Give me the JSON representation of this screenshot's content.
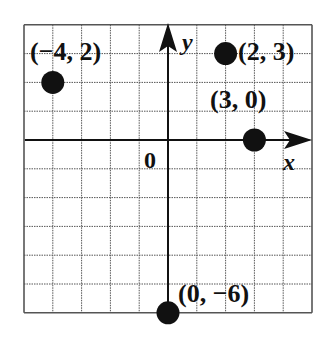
{
  "chart_data": {
    "type": "scatter",
    "title": "",
    "xlabel": "x",
    "ylabel": "y",
    "origin_label": "0",
    "xlim": [
      -5,
      5
    ],
    "ylim": [
      -6,
      4
    ],
    "grid": true,
    "grid_step": 1,
    "points": [
      {
        "x": -4,
        "y": 2,
        "label": "(−4, 2)"
      },
      {
        "x": 2,
        "y": 3,
        "label": "(2, 3)"
      },
      {
        "x": 3,
        "y": 0,
        "label": "(3, 0)"
      },
      {
        "x": 0,
        "y": -6,
        "label": "(0, −6)"
      }
    ]
  },
  "colors": {
    "point": "#111111",
    "grid": "#555555",
    "axis": "#111111",
    "background": "#ffffff"
  }
}
